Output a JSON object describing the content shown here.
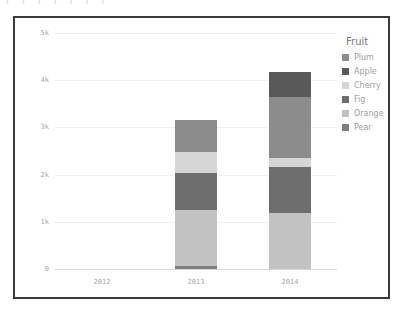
{
  "top_strip": {
    "ghost_text": "|        |    |    |        |       |     |"
  },
  "legend": {
    "title": "Fruit",
    "items": [
      {
        "label": "Plum",
        "color": "#8c8c8c"
      },
      {
        "label": "Apple",
        "color": "#595959"
      },
      {
        "label": "Cherry",
        "color": "#d5d5d5"
      },
      {
        "label": "Fig",
        "color": "#6e6e6e"
      },
      {
        "label": "Orange",
        "color": "#c2c2c2"
      },
      {
        "label": "Pear",
        "color": "#7f7f7f"
      }
    ]
  },
  "chart_data": {
    "type": "bar",
    "subtype": "stacked",
    "title": "",
    "xlabel": "",
    "ylabel": "",
    "categories": [
      "2012",
      "2013",
      "2014"
    ],
    "ylim": [
      0,
      5000
    ],
    "ytick_values": [
      0,
      1000,
      2000,
      3000,
      4000,
      5000
    ],
    "ytick_labels": [
      "0",
      "1k",
      "2k",
      "3k",
      "4k",
      "5k"
    ],
    "grid": true,
    "legend_position": "right",
    "legend_title": "Fruit",
    "stack_order_bottom_to_top": [
      "Pear",
      "Orange",
      "Fig",
      "Cherry",
      "Plum",
      "Apple"
    ],
    "series": [
      {
        "name": "Pear",
        "color": "#7f7f7f",
        "values": [
          0,
          60,
          0
        ]
      },
      {
        "name": "Orange",
        "color": "#c2c2c2",
        "values": [
          0,
          1180,
          1180
        ]
      },
      {
        "name": "Fig",
        "color": "#6e6e6e",
        "values": [
          0,
          800,
          990
        ]
      },
      {
        "name": "Cherry",
        "color": "#d5d5d5",
        "values": [
          0,
          440,
          180
        ]
      },
      {
        "name": "Plum",
        "color": "#8c8c8c",
        "values": [
          0,
          680,
          1290
        ]
      },
      {
        "name": "Apple",
        "color": "#595959",
        "values": [
          0,
          0,
          540
        ]
      }
    ],
    "totals": [
      0,
      3160,
      4180
    ]
  },
  "style": {
    "frame_border_color": "#3a3a3a",
    "gridline_color": "#f0f0f0",
    "axis_color": "#d8d8d8",
    "tick_label_color": "#a8a8a8",
    "legend_title_color": "#7a7a7a",
    "legend_label_color": "#a0a0a0",
    "background": "#ffffff"
  }
}
